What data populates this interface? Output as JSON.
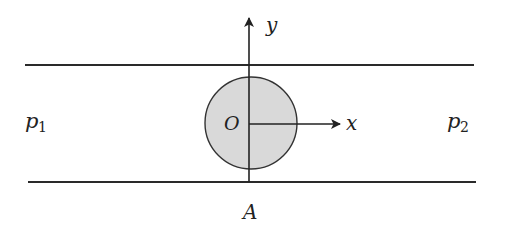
{
  "diagram": {
    "colors": {
      "line": "#2a2a2a",
      "circle_fill": "#d9d9d9",
      "circle_stroke": "#333333",
      "background": "#ffffff"
    },
    "labels": {
      "y_axis": "y",
      "x_axis": "x",
      "origin": "O",
      "point_a": "A",
      "p1_base": "p",
      "p1_sub": "1",
      "p2_base": "p",
      "p2_sub": "2"
    }
  }
}
